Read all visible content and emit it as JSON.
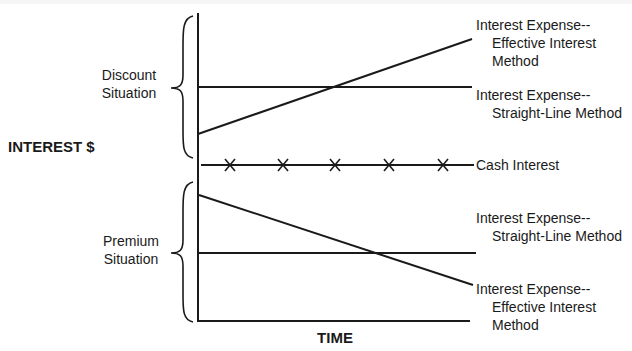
{
  "diagram": {
    "y_axis_label": "INTEREST $",
    "x_axis_label": "TIME",
    "discount": {
      "label_line1": "Discount",
      "label_line2": "Situation",
      "effective": {
        "line1": "Interest Expense--",
        "line2": "Effective Interest",
        "line3": "Method"
      },
      "straight": {
        "line1": "Interest Expense--",
        "line2": "Straight-Line Method"
      }
    },
    "cash": {
      "label": "Cash Interest",
      "marker": "x",
      "marker_count": 5
    },
    "premium": {
      "label_line1": "Premium",
      "label_line2": "Situation",
      "straight": {
        "line1": "Interest Expense--",
        "line2": "Straight-Line Method"
      },
      "effective": {
        "line1": "Interest Expense--",
        "line2": "Effective Interest",
        "line3": "Method"
      }
    },
    "colors": {
      "ink": "#1a1a1a",
      "background": "#ffffff"
    }
  }
}
